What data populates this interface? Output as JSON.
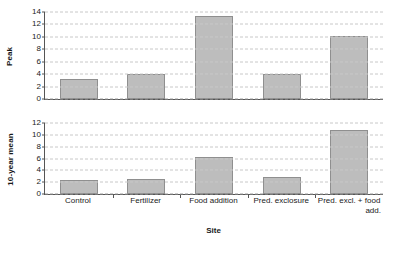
{
  "chart_data": {
    "type": "bar",
    "title": "",
    "xlabel": "Site",
    "categories": [
      "Control",
      "Fertilizer",
      "Food addition",
      "Pred. exclosure",
      "Pred. excl. + food add."
    ],
    "category_lines": [
      [
        "Control"
      ],
      [
        "Fertilizer"
      ],
      [
        "Food addition"
      ],
      [
        "Pred. exclosure"
      ],
      [
        "Pred. excl. + food",
        "add."
      ]
    ],
    "grid": true,
    "legend": "none",
    "panels": [
      {
        "ylabel": "Peak",
        "ylim": [
          0,
          14
        ],
        "yticks": [
          0,
          2,
          4,
          6,
          8,
          10,
          12,
          14
        ],
        "ytick_labels": [
          "0",
          "2",
          "4",
          "6",
          "8",
          "10",
          "12",
          "14"
        ],
        "values": [
          3.2,
          4.0,
          13.3,
          4.0,
          10.2
        ]
      },
      {
        "ylabel": "10-year mean",
        "ylim": [
          0,
          12
        ],
        "yticks": [
          0,
          2,
          4,
          6,
          8,
          10,
          12
        ],
        "ytick_labels": [
          "0",
          "2",
          "4",
          "6",
          "8",
          "10",
          "12"
        ],
        "values": [
          2.4,
          2.5,
          6.2,
          2.9,
          10.8
        ]
      }
    ],
    "colors": {
      "bar_fill": "#bdbdbd",
      "bar_edge": "#8f8f8f",
      "grid": "#c8c8c8",
      "axis": "#555555",
      "text": "#1a1a1a",
      "background": "#ffffff"
    }
  }
}
